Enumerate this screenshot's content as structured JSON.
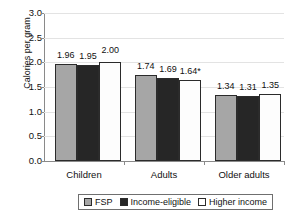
{
  "chart_data": {
    "type": "bar",
    "title": "",
    "subtitle": "",
    "xlabel": "",
    "ylabel": "Calories per gram",
    "ylim": [
      0.0,
      3.0
    ],
    "ytick_step": 0.5,
    "ytick_labels": [
      "3.0",
      "2.5",
      "2.0",
      "1.5",
      "1.0",
      "0.5",
      "0.0"
    ],
    "ytick_values": [
      3.0,
      2.5,
      2.0,
      1.5,
      1.0,
      0.5,
      0.0
    ],
    "grid": true,
    "grid_axis": "y",
    "legend_position": "bottom",
    "categories": [
      "Children",
      "Adults",
      "Older adults"
    ],
    "series": [
      {
        "name": "FSP",
        "color": "#a6a6a6",
        "values": [
          1.96,
          1.74,
          1.34
        ],
        "labels": [
          "1.96",
          "1.74",
          "1.34"
        ]
      },
      {
        "name": "Income-eligible",
        "color": "#262626",
        "values": [
          1.95,
          1.69,
          1.31
        ],
        "labels": [
          "1.95",
          "1.69",
          "1.31"
        ]
      },
      {
        "name": "Higher income",
        "color": "#ffffff",
        "values": [
          2.0,
          1.64,
          1.35
        ],
        "labels": [
          "2.00",
          "1.64*",
          "1.35"
        ]
      }
    ],
    "annotations": [
      "* indicates statistical significance"
    ]
  }
}
